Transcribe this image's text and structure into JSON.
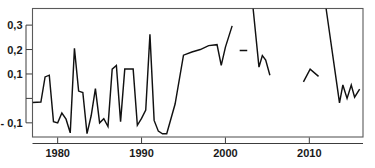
{
  "chart_data": {
    "type": "line",
    "title": "",
    "subtitle": "",
    "xlabel": "",
    "ylabel": "",
    "grid": false,
    "legend": null,
    "decimal_separator": ",",
    "xlim": [
      1977,
      2016.4
    ],
    "ylim": [
      -0.158,
      0.368
    ],
    "x_ticks": [
      1980,
      1990,
      2000,
      2010
    ],
    "x_tick_labels": [
      "1980",
      "1990",
      "2000",
      "2010"
    ],
    "y_ticks": [
      0.3,
      0.2,
      0.1,
      0.0,
      -0.1
    ],
    "y_tick_labels": [
      "0,3",
      "0,2",
      "0,1",
      "",
      "- 0,1"
    ],
    "series": [
      {
        "name": "series-1",
        "note": "Single black line with breaks (missing years)",
        "color": "#111111",
        "x": [
          1977,
          1978,
          1978.5,
          1979,
          1979.5,
          1980,
          1980.5,
          1981,
          1981.5,
          1982,
          1982.5,
          1983,
          1983.5,
          1984,
          1984.5,
          1985,
          1985.5,
          1986,
          1986.5,
          1987,
          1987.5,
          1988,
          1989,
          1989.5,
          1990,
          1990.5,
          1991,
          1991.5,
          1992,
          1992.5,
          1993,
          1994,
          1995,
          1996,
          1997,
          1998,
          1999,
          1999.5,
          2000,
          2000.8
        ],
        "y": [
          -0.017,
          -0.015,
          0.088,
          0.095,
          -0.095,
          -0.1,
          -0.06,
          -0.085,
          -0.141,
          0.205,
          0.03,
          0.024,
          -0.144,
          -0.07,
          0.04,
          -0.1,
          -0.083,
          -0.115,
          0.12,
          0.135,
          -0.095,
          0.12,
          0.12,
          -0.11,
          -0.082,
          -0.048,
          0.262,
          -0.09,
          -0.134,
          -0.145,
          -0.145,
          -0.023,
          0.177,
          0.19,
          0.2,
          0.216,
          0.22,
          0.135,
          0.21,
          0.297
        ]
      },
      {
        "name": "series-1-segment-2",
        "note": "Isolated short flat dash around 2002",
        "color": "#111111",
        "x": [
          2001.7,
          2002.6
        ],
        "y": [
          0.196,
          0.196
        ]
      },
      {
        "name": "series-1-segment-3",
        "note": "Clipped high value at 2003 dropping through 2005",
        "color": "#111111",
        "x": [
          2003.3,
          2004,
          2004.4,
          2004.8,
          2005.3
        ],
        "y": [
          0.368,
          0.128,
          0.175,
          0.157,
          0.095
        ]
      },
      {
        "name": "series-1-segment-4",
        "note": "Short arc near 2009-2011",
        "color": "#111111",
        "x": [
          2009.3,
          2010.1,
          2011.1
        ],
        "y": [
          0.068,
          0.12,
          0.09
        ]
      },
      {
        "name": "series-1-segment-5",
        "note": "Clipped high value at 2012 falling then zig-zag to 2016",
        "color": "#111111",
        "x": [
          2012.0,
          2013.6,
          2014.0,
          2014.5,
          2015.0,
          2015.4,
          2016.0
        ],
        "y": [
          0.368,
          -0.018,
          0.055,
          0.0,
          0.055,
          0.005,
          0.038
        ]
      }
    ]
  }
}
